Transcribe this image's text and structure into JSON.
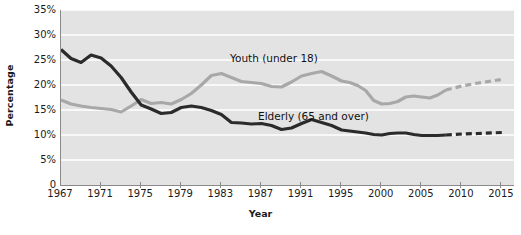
{
  "chart_data": {
    "type": "line",
    "title": "",
    "xlabel": "Year",
    "ylabel": "Percentage",
    "xlim": [
      1967,
      2015
    ],
    "ylim": [
      0,
      35
    ],
    "grid": true,
    "grid_axis": "y",
    "legend_position": "inline-annotation",
    "y_ticks": [
      0,
      5,
      10,
      15,
      20,
      25,
      30,
      35
    ],
    "y_tick_labels": [
      "0",
      "5%",
      "10%",
      "15%",
      "20%",
      "25%",
      "30%",
      "35%"
    ],
    "x_ticks": [
      1967,
      1971,
      1975,
      1979,
      1983,
      1987,
      1991,
      1995,
      2000,
      2005,
      2010,
      2015
    ],
    "x_tick_labels": [
      "1967",
      "1971",
      "1975",
      "1979",
      "1983",
      "1987",
      "1991",
      "1995",
      "2000",
      "2005",
      "2010",
      "2015"
    ],
    "colors": {
      "plot_background": "#e3e3e3",
      "gridline": "#ffffff",
      "axis": "#8a8a8a",
      "youth": "#a8a8a8",
      "elderly": "#2b2b2b",
      "text": "#1a1a1a"
    },
    "series": [
      {
        "name": "Youth (under 18)",
        "label": "Youth (under 18)",
        "color": "#a8a8a8",
        "style": "solid",
        "projection_style": "dashed",
        "projection_starts": 2008,
        "x": [
          1967,
          1968,
          1969,
          1970,
          1971,
          1972,
          1973,
          1974,
          1975,
          1976,
          1977,
          1978,
          1979,
          1980,
          1981,
          1982,
          1983,
          1984,
          1985,
          1986,
          1987,
          1988,
          1989,
          1990,
          1991,
          1992,
          1993,
          1994,
          1995,
          1996,
          1997,
          1998,
          1999,
          2000,
          2001,
          2002,
          2003,
          2004,
          2005,
          2006,
          2007,
          2008,
          2010,
          2012,
          2015
        ],
        "y": [
          17.0,
          16.2,
          15.8,
          15.5,
          15.3,
          15.1,
          14.6,
          15.8,
          17.1,
          16.3,
          16.5,
          16.2,
          17.1,
          18.3,
          20.0,
          21.9,
          22.3,
          21.5,
          20.7,
          20.5,
          20.3,
          19.7,
          19.6,
          20.6,
          21.8,
          22.3,
          22.7,
          21.8,
          20.8,
          20.5,
          19.9,
          18.9,
          16.9,
          16.2,
          16.3,
          16.7,
          17.6,
          17.8,
          17.6,
          17.4,
          18.0,
          19.0,
          19.8,
          20.4,
          21.1
        ]
      },
      {
        "name": "Elderly (65 and over)",
        "label": "Elderly (65 and over)",
        "color": "#2b2b2b",
        "style": "solid",
        "projection_style": "dashed",
        "projection_starts": 2008,
        "x": [
          1967,
          1968,
          1969,
          1970,
          1971,
          1972,
          1973,
          1974,
          1975,
          1976,
          1977,
          1978,
          1979,
          1980,
          1981,
          1982,
          1983,
          1984,
          1985,
          1986,
          1987,
          1988,
          1989,
          1990,
          1991,
          1992,
          1993,
          1994,
          1995,
          1996,
          1997,
          1998,
          1999,
          2000,
          2001,
          2002,
          2003,
          2004,
          2005,
          2006,
          2007,
          2008,
          2010,
          2012,
          2015
        ],
        "y": [
          27.1,
          25.3,
          24.5,
          26.0,
          25.4,
          23.8,
          21.5,
          18.6,
          16.0,
          15.2,
          14.3,
          14.5,
          15.5,
          15.8,
          15.5,
          14.9,
          14.1,
          12.5,
          12.4,
          12.2,
          12.3,
          11.9,
          11.1,
          11.4,
          12.3,
          13.1,
          12.5,
          11.9,
          11.0,
          10.8,
          10.6,
          10.4,
          10.1,
          10.0,
          10.3,
          10.4,
          10.4,
          10.1,
          9.9,
          9.9,
          9.9,
          10.0,
          10.2,
          10.3,
          10.5
        ]
      }
    ]
  },
  "axis": {
    "y_title": "Percentage",
    "x_title": "Year"
  }
}
